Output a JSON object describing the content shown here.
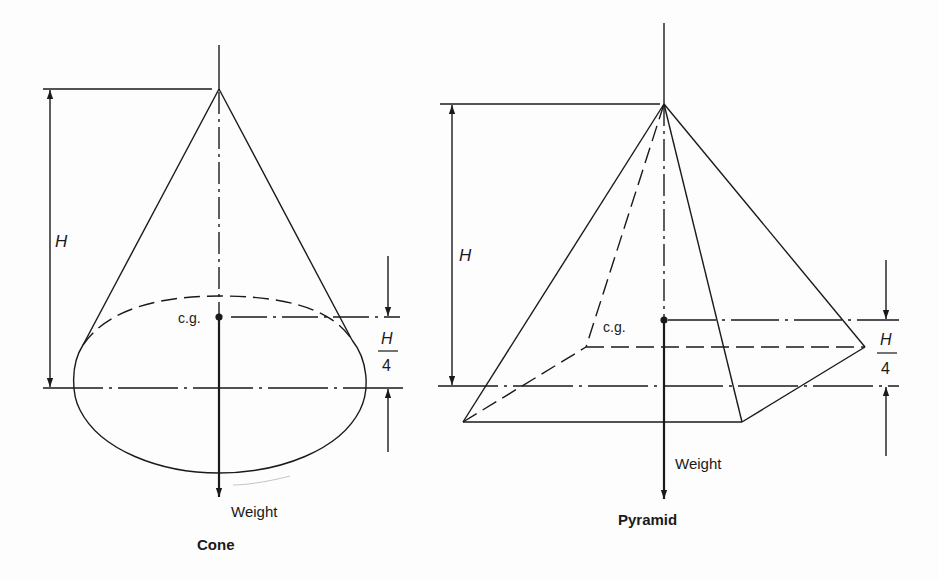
{
  "figure": {
    "cone": {
      "title": "Cone",
      "height_label": "H",
      "cg_label": "c.g.",
      "weight_label": "Weight",
      "offset_numerator": "H",
      "offset_denominator": "4"
    },
    "pyramid": {
      "title": "Pyramid",
      "height_label": "H",
      "cg_label": "c.g.",
      "weight_label": "Weight",
      "offset_numerator": "H",
      "offset_denominator": "4"
    },
    "colors": {
      "ink": "#1a1a1a",
      "paper": "#fdfdfd"
    }
  }
}
